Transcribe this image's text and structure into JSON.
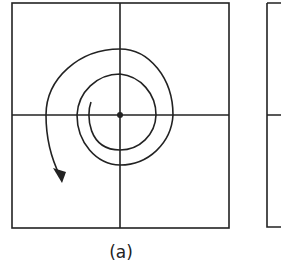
{
  "figure": {
    "panel_label": "(a)",
    "colors": {
      "stroke": "#222222",
      "background": "#ffffff"
    }
  }
}
